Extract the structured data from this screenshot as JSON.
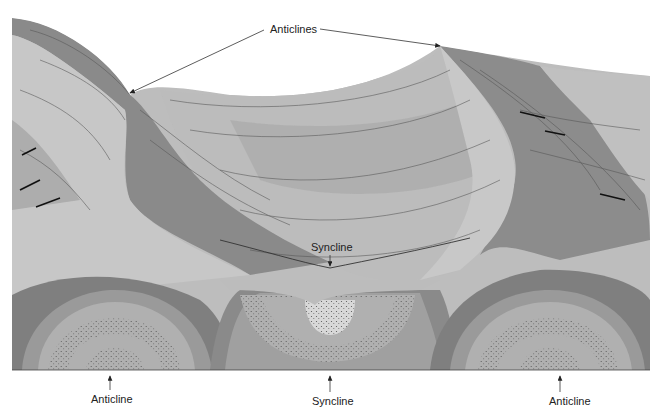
{
  "figure": {
    "colors": {
      "background": "#ffffff",
      "dark_layer": "#7a7a7a",
      "mid_dark_layer": "#8e8e8e",
      "mid_layer": "#a8a8a8",
      "light_layer": "#bdbdbd",
      "pale_layer": "#cfcfcf",
      "stipple_layer": "#b4b4b4",
      "line": "#333333"
    },
    "labels": {
      "top": "Anticlines",
      "middle": "Syncline",
      "bottom_left": "Anticline",
      "bottom_center": "Syncline",
      "bottom_right": "Anticline"
    }
  }
}
